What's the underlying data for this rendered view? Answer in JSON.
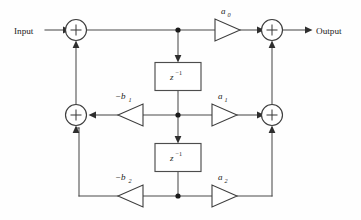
{
  "diagram": {
    "type": "signal-flow-block-diagram",
    "background_color": "#fefefe",
    "line_color": "#4a4a4a",
    "io": {
      "input_label": "Input",
      "output_label": "Output"
    },
    "delay_blocks": [
      {
        "id": "delay-1",
        "base": "z",
        "exponent": "−1",
        "label": "z⁻¹"
      },
      {
        "id": "delay-2",
        "base": "z",
        "exponent": "−1",
        "label": "z⁻¹"
      }
    ],
    "gains": [
      {
        "id": "gain-a0",
        "base": "a",
        "subscript": "0",
        "label": "a₀",
        "direction": "right",
        "row": "top"
      },
      {
        "id": "gain-b1",
        "base": "−b",
        "subscript": "1",
        "label": "−b₁",
        "direction": "left",
        "row": "middle"
      },
      {
        "id": "gain-a1",
        "base": "a",
        "subscript": "1",
        "label": "a₁",
        "direction": "right",
        "row": "middle"
      },
      {
        "id": "gain-b2",
        "base": "−b",
        "subscript": "2",
        "label": "−b₂",
        "direction": "left",
        "row": "bottom"
      },
      {
        "id": "gain-a2",
        "base": "a",
        "subscript": "2",
        "label": "a₂",
        "direction": "right",
        "row": "bottom"
      }
    ],
    "adders": [
      {
        "id": "adder-top-left",
        "symbol": "+",
        "row": "top",
        "side": "left"
      },
      {
        "id": "adder-top-right",
        "symbol": "+",
        "row": "top",
        "side": "right"
      },
      {
        "id": "adder-mid-left",
        "symbol": "+",
        "row": "middle",
        "side": "left"
      },
      {
        "id": "adder-mid-right",
        "symbol": "+",
        "row": "middle",
        "side": "right"
      }
    ],
    "nodes": [
      {
        "id": "node-top",
        "row": "top"
      },
      {
        "id": "node-middle",
        "row": "middle"
      },
      {
        "id": "node-bottom",
        "row": "bottom"
      }
    ]
  }
}
